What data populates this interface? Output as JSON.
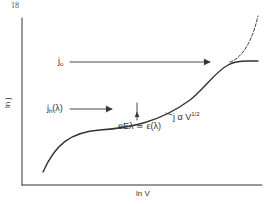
{
  "figure": {
    "page_number": "18",
    "x_axis_label": "ln V",
    "y_axis_label": "ln j",
    "annotations": {
      "j0": {
        "base": "j",
        "sub": "o"
      },
      "jh": {
        "base": "j",
        "sub": "h",
        "tail": "(λ)"
      },
      "slope": {
        "text": "j α V",
        "sup": "1/2"
      },
      "condition": "eEλ ≃ ε(λ)"
    },
    "colors": {
      "line": "#333333",
      "background": "#ffffff"
    }
  }
}
